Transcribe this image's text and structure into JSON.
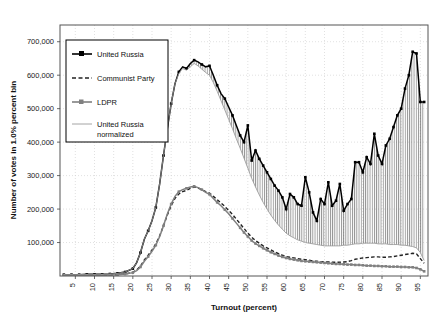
{
  "chart_data": {
    "type": "line",
    "title": "",
    "xlabel": "Turnout (percent)",
    "ylabel": "Number of votes in 1.0% percent bin",
    "xlim": [
      1,
      97
    ],
    "ylim": [
      0,
      750000
    ],
    "xticks": [
      5,
      10,
      15,
      20,
      25,
      30,
      35,
      40,
      45,
      50,
      55,
      60,
      65,
      70,
      75,
      80,
      85,
      90,
      95
    ],
    "xtick_labels": [
      "5",
      "10",
      "15",
      "20",
      "25",
      "30",
      "35",
      "40",
      "45",
      "50",
      "55",
      "60",
      "65",
      "70",
      "75",
      "80",
      "85",
      "90",
      "95"
    ],
    "yticks": [
      100000,
      200000,
      300000,
      400000,
      500000,
      600000,
      700000
    ],
    "ytick_labels": [
      "100,000",
      "200,000",
      "300,000",
      "400,000",
      "500,000",
      "600,000",
      "700,000"
    ],
    "grid": true,
    "legend_position": "upper-left",
    "fill_between": {
      "upper": "United Russia",
      "lower": "United Russia normalized",
      "hatch": "vertical"
    },
    "x": [
      2,
      4,
      6,
      8,
      10,
      12,
      14,
      16,
      18,
      20,
      21,
      22,
      23,
      24,
      25,
      26,
      27,
      28,
      29,
      30,
      31,
      32,
      33,
      34,
      35,
      36,
      37,
      38,
      39,
      40,
      41,
      42,
      43,
      44,
      45,
      46,
      47,
      48,
      49,
      50,
      51,
      52,
      53,
      54,
      55,
      56,
      57,
      58,
      59,
      60,
      61,
      62,
      63,
      64,
      65,
      66,
      67,
      68,
      69,
      70,
      71,
      72,
      73,
      74,
      75,
      76,
      77,
      78,
      79,
      80,
      81,
      82,
      83,
      84,
      85,
      86,
      87,
      88,
      89,
      90,
      91,
      92,
      93,
      94,
      95,
      96
    ],
    "series": [
      {
        "name": "United Russia",
        "style": "solid-black-markers",
        "color": "#000000",
        "values": [
          4000,
          4000,
          4000,
          5000,
          5000,
          5000,
          6000,
          8000,
          12000,
          22000,
          40000,
          70000,
          110000,
          135000,
          165000,
          205000,
          275000,
          360000,
          440000,
          515000,
          575000,
          610000,
          625000,
          620000,
          635000,
          645000,
          640000,
          632000,
          625000,
          628000,
          600000,
          570000,
          545000,
          530000,
          505000,
          480000,
          450000,
          420000,
          400000,
          450000,
          345000,
          375000,
          350000,
          330000,
          310000,
          290000,
          270000,
          255000,
          235000,
          200000,
          245000,
          235000,
          215000,
          210000,
          295000,
          250000,
          190000,
          165000,
          230000,
          215000,
          280000,
          210000,
          225000,
          275000,
          195000,
          215000,
          230000,
          340000,
          340000,
          310000,
          355000,
          335000,
          425000,
          360000,
          335000,
          390000,
          410000,
          445000,
          480000,
          500000,
          560000,
          600000,
          670000,
          665000,
          520000,
          520000
        ]
      },
      {
        "name": "Communist Party",
        "style": "dashed",
        "color": "#222222",
        "values": [
          2000,
          2000,
          2000,
          2000,
          2000,
          2500,
          3000,
          4000,
          6000,
          11000,
          18000,
          30000,
          48000,
          62000,
          78000,
          96000,
          120000,
          150000,
          182000,
          210000,
          232000,
          245000,
          252000,
          256000,
          262000,
          266000,
          263000,
          258000,
          252000,
          248000,
          238000,
          228000,
          218000,
          208000,
          196000,
          184000,
          170000,
          156000,
          142000,
          128000,
          116000,
          106000,
          98000,
          90000,
          84000,
          78000,
          72000,
          67000,
          62000,
          58000,
          56000,
          54000,
          52000,
          50000,
          49000,
          47000,
          45000,
          44000,
          43000,
          42000,
          42000,
          41000,
          41000,
          41000,
          42000,
          43000,
          46000,
          50000,
          52000,
          54000,
          55000,
          56000,
          57000,
          57000,
          56000,
          56000,
          57000,
          58000,
          60000,
          62000,
          64000,
          66000,
          68000,
          66000,
          52000,
          38000
        ]
      },
      {
        "name": "LDPR",
        "style": "solid-gray-markers",
        "color": "#808080",
        "values": [
          2000,
          2000,
          2000,
          2000,
          2000,
          2500,
          3000,
          4000,
          6000,
          10000,
          16000,
          27000,
          44000,
          58000,
          74000,
          92000,
          118000,
          150000,
          185000,
          215000,
          238000,
          252000,
          258000,
          262000,
          266000,
          268000,
          264000,
          258000,
          250000,
          244000,
          232000,
          220000,
          210000,
          198000,
          186000,
          172000,
          158000,
          144000,
          130000,
          118000,
          106000,
          97000,
          90000,
          83000,
          77000,
          71000,
          66000,
          61000,
          57000,
          54000,
          51000,
          49000,
          47000,
          45000,
          44000,
          43000,
          42000,
          41000,
          40000,
          39000,
          38000,
          37000,
          36000,
          36000,
          35000,
          34000,
          34000,
          33000,
          33000,
          32000,
          31000,
          31000,
          30000,
          30000,
          29000,
          29000,
          28000,
          28000,
          28000,
          27000,
          27000,
          26000,
          26000,
          24000,
          20000,
          14000
        ]
      },
      {
        "name": "United Russia normalized",
        "style": "thin-gray",
        "color": "#9a9a9a",
        "values": [
          4000,
          4000,
          4000,
          5000,
          5000,
          5000,
          6000,
          8000,
          12000,
          22000,
          40000,
          70000,
          110000,
          135000,
          165000,
          205000,
          275000,
          360000,
          440000,
          515000,
          575000,
          605000,
          620000,
          615000,
          625000,
          635000,
          628000,
          618000,
          608000,
          600000,
          578000,
          552000,
          524000,
          496000,
          468000,
          440000,
          410000,
          382000,
          352000,
          322000,
          292000,
          266000,
          242000,
          220000,
          200000,
          182000,
          166000,
          152000,
          140000,
          128000,
          120000,
          114000,
          108000,
          104000,
          100000,
          98000,
          96000,
          94000,
          92000,
          90000,
          90000,
          90000,
          90000,
          90000,
          92000,
          92000,
          94000,
          96000,
          96000,
          98000,
          98000,
          98000,
          98000,
          96000,
          96000,
          96000,
          94000,
          94000,
          94000,
          92000,
          92000,
          90000,
          88000,
          84000,
          70000,
          46000
        ]
      }
    ]
  },
  "legend": {
    "entries": [
      {
        "label": "United Russia",
        "style": "solid-black-markers"
      },
      {
        "label": "Communist Party",
        "style": "dashed"
      },
      {
        "label": "LDPR",
        "style": "solid-gray-markers"
      },
      {
        "label": "United Russia",
        "label2": "normalized",
        "style": "thin-gray"
      }
    ]
  }
}
